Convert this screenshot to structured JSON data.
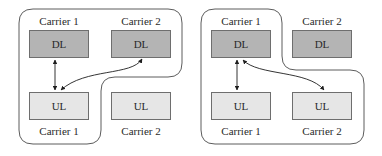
{
  "colors": {
    "dl_fill": "#b4b4b4",
    "ul_fill": "#e6e6e6",
    "box_border": "#6e6e6e",
    "outline": "#4a4a4a",
    "arrow": "#1e1e1e"
  },
  "panels": [
    {
      "top_labels": [
        "Carrier 1",
        "Carrier 2"
      ],
      "bottom_labels": [
        "Carrier 1",
        "Carrier 2"
      ],
      "dl_boxes": [
        "DL",
        "DL"
      ],
      "ul_boxes": [
        "UL",
        "UL"
      ],
      "grouping": "DL Carrier 1, DL Carrier 2, UL Carrier 1",
      "links": [
        "DL1 <-> UL1",
        "DL2 <-> UL1"
      ]
    },
    {
      "top_labels": [
        "Carrier 1",
        "Carrier 2"
      ],
      "bottom_labels": [
        "Carrier 1",
        "Carrier 2"
      ],
      "dl_boxes": [
        "DL",
        "DL"
      ],
      "ul_boxes": [
        "UL",
        "UL"
      ],
      "grouping": "DL Carrier 1, UL Carrier 1, UL Carrier 2",
      "links": [
        "DL1 <-> UL1",
        "DL1 <-> UL2"
      ]
    }
  ]
}
